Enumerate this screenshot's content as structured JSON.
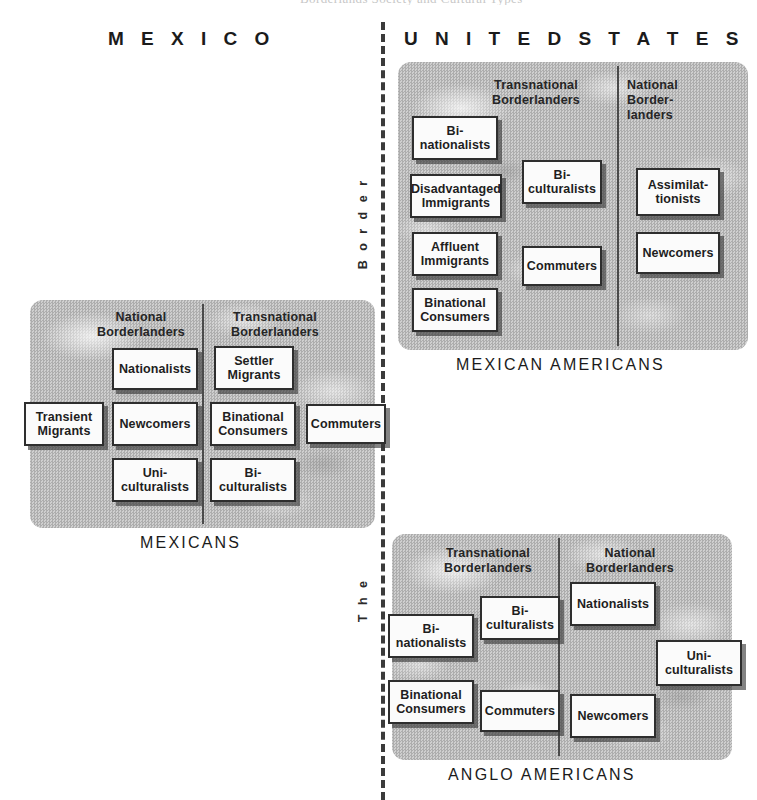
{
  "caption_remnant": "Borderlands Society and Cultural Types",
  "countries": {
    "mexico": "M E X I C O",
    "united_states": "U N I T E D   S T A T E S"
  },
  "boundary": {
    "vertical_top_word": "B o r d e r",
    "vertical_bottom_word": "T h e",
    "full_phrase": "The Border",
    "style": "dashed",
    "color": "#3b3b3b"
  },
  "colors": {
    "panel_gray": "#bdbdbd",
    "box_fill": "#fbfbfb",
    "box_border": "#2e2e2e",
    "text": "#1e1e1e"
  },
  "panels": [
    {
      "id": "mexican-americans",
      "group_label": "MEXICAN AMERICANS",
      "columns": [
        {
          "heading": "Transnational\nBorderlanders",
          "boxes": [
            "Bi-\nnationalists",
            "Disadvantaged\nImmigrants",
            "Affluent\nImmigrants",
            "Binational\nConsumers",
            "Bi-\nculturalists",
            "Commuters"
          ]
        },
        {
          "heading": "National\nBorder-\nlanders",
          "boxes": [
            "Assimilat-\ntionists",
            "Newcomers"
          ]
        }
      ]
    },
    {
      "id": "mexicans",
      "group_label": "MEXICANS",
      "columns": [
        {
          "heading": "National\nBorderlanders",
          "boxes": [
            "Nationalists",
            "Transient\nMigrants",
            "Newcomers",
            "Uni-\nculturalists"
          ]
        },
        {
          "heading": "Transnational\nBorderlanders",
          "boxes": [
            "Settler\nMigrants",
            "Binational\nConsumers",
            "Commuters",
            "Bi-\nculturalists"
          ]
        }
      ]
    },
    {
      "id": "anglo-americans",
      "group_label": "ANGLO AMERICANS",
      "columns": [
        {
          "heading": "Transnational\nBorderlanders",
          "boxes": [
            "Bi-\nnationalists",
            "Bi-\nculturalists",
            "Binational\nConsumers",
            "Commuters"
          ]
        },
        {
          "heading": "National\nBorderlanders",
          "boxes": [
            "Nationalists",
            "Uni-\nculturalists",
            "Newcomers"
          ]
        }
      ]
    }
  ],
  "ma": {
    "head_trans": "Transnational\nBorderlanders",
    "head_nat": "National\nBorder-\nlanders",
    "b1": "Bi-\nnationalists",
    "b2": "Disadvantaged\nImmigrants",
    "b3": "Affluent\nImmigrants",
    "b4": "Binational\nConsumers",
    "b5": "Bi-\nculturalists",
    "b6": "Commuters",
    "b7": "Assimilat-\ntionists",
    "b8": "Newcomers"
  },
  "mx": {
    "head_nat": "National\nBorderlanders",
    "head_trans": "Transnational\nBorderlanders",
    "b1": "Nationalists",
    "b2": "Settler\nMigrants",
    "b3": "Transient\nMigrants",
    "b4": "Newcomers",
    "b5": "Binational\nConsumers",
    "b6": "Commuters",
    "b7": "Uni-\nculturalists",
    "b8": "Bi-\nculturalists"
  },
  "aa": {
    "head_trans": "Transnational\nBorderlanders",
    "head_nat": "National\nBorderlanders",
    "b1": "Bi-\nnationalists",
    "b2": "Bi-\nculturalists",
    "b3": "Nationalists",
    "b4": "Uni-\nculturalists",
    "b5": "Binational\nConsumers",
    "b6": "Commuters",
    "b7": "Newcomers"
  },
  "group_labels": {
    "mexican_americans": "MEXICAN AMERICANS",
    "mexicans": "MEXICANS",
    "anglo_americans": "ANGLO AMERICANS"
  }
}
